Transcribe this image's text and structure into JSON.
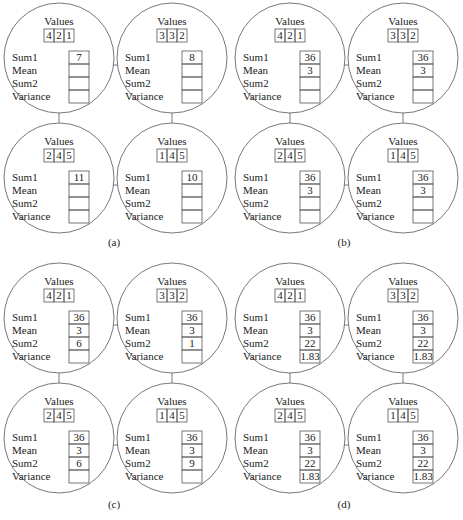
{
  "figure": {
    "row_labels": [
      "Sum1",
      "Mean",
      "Sum2",
      "Variance"
    ],
    "values_heading": "Values",
    "panels": [
      {
        "caption": "(a)",
        "nodes": [
          {
            "values": [
              "4",
              "2",
              "1"
            ],
            "sum1": "7",
            "mean": "",
            "sum2": "",
            "variance": ""
          },
          {
            "values": [
              "3",
              "3",
              "2"
            ],
            "sum1": "8",
            "mean": "",
            "sum2": "",
            "variance": ""
          },
          {
            "values": [
              "2",
              "4",
              "5"
            ],
            "sum1": "11",
            "mean": "",
            "sum2": "",
            "variance": ""
          },
          {
            "values": [
              "1",
              "4",
              "5"
            ],
            "sum1": "10",
            "mean": "",
            "sum2": "",
            "variance": ""
          }
        ]
      },
      {
        "caption": "(b)",
        "nodes": [
          {
            "values": [
              "4",
              "2",
              "1"
            ],
            "sum1": "36",
            "mean": "3",
            "sum2": "",
            "variance": ""
          },
          {
            "values": [
              "3",
              "3",
              "2"
            ],
            "sum1": "36",
            "mean": "3",
            "sum2": "",
            "variance": ""
          },
          {
            "values": [
              "2",
              "4",
              "5"
            ],
            "sum1": "36",
            "mean": "3",
            "sum2": "",
            "variance": ""
          },
          {
            "values": [
              "1",
              "4",
              "5"
            ],
            "sum1": "36",
            "mean": "3",
            "sum2": "",
            "variance": ""
          }
        ]
      },
      {
        "caption": "(c)",
        "nodes": [
          {
            "values": [
              "4",
              "2",
              "1"
            ],
            "sum1": "36",
            "mean": "3",
            "sum2": "6",
            "variance": ""
          },
          {
            "values": [
              "3",
              "3",
              "2"
            ],
            "sum1": "36",
            "mean": "3",
            "sum2": "1",
            "variance": ""
          },
          {
            "values": [
              "2",
              "4",
              "5"
            ],
            "sum1": "36",
            "mean": "3",
            "sum2": "6",
            "variance": ""
          },
          {
            "values": [
              "1",
              "4",
              "5"
            ],
            "sum1": "36",
            "mean": "3",
            "sum2": "9",
            "variance": ""
          }
        ]
      },
      {
        "caption": "(d)",
        "nodes": [
          {
            "values": [
              "4",
              "2",
              "1"
            ],
            "sum1": "36",
            "mean": "3",
            "sum2": "22",
            "variance": "1.83"
          },
          {
            "values": [
              "3",
              "3",
              "2"
            ],
            "sum1": "36",
            "mean": "3",
            "sum2": "22",
            "variance": "1.83"
          },
          {
            "values": [
              "2",
              "4",
              "5"
            ],
            "sum1": "36",
            "mean": "3",
            "sum2": "22",
            "variance": "1.83"
          },
          {
            "values": [
              "1",
              "4",
              "5"
            ],
            "sum1": "36",
            "mean": "3",
            "sum2": "22",
            "variance": "1.83"
          }
        ]
      }
    ]
  }
}
